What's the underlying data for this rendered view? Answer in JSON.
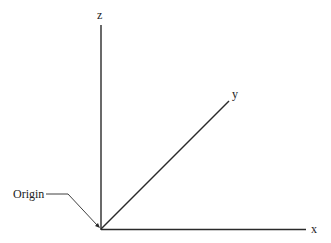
{
  "diagram": {
    "axes": {
      "x_label": "x",
      "y_label": "y",
      "z_label": "z"
    },
    "origin_label": "Origin",
    "colors": {
      "line": "#2a2a2a",
      "background": "#ffffff"
    }
  }
}
